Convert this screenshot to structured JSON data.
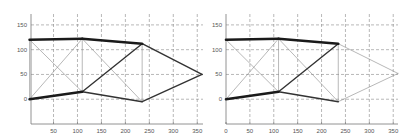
{
  "chart_data": [
    {
      "type": "line",
      "title": "",
      "xlabel": "",
      "ylabel": "",
      "xlim": [
        3,
        362
      ],
      "ylim": [
        -50,
        172
      ],
      "grid": true,
      "xticks": [
        50,
        100,
        150,
        200,
        250,
        300,
        350
      ],
      "yticks": [
        0,
        50,
        100,
        150
      ],
      "nodes": {
        "A": [
          0,
          120
        ],
        "B": [
          110,
          122
        ],
        "C": [
          235,
          112
        ],
        "D": [
          360,
          50
        ],
        "E": [
          0,
          0
        ],
        "F": [
          110,
          15
        ],
        "G": [
          235,
          -5
        ]
      },
      "members": [
        {
          "from": "A",
          "to": "B",
          "weight": "thick"
        },
        {
          "from": "B",
          "to": "C",
          "weight": "thick"
        },
        {
          "from": "E",
          "to": "F",
          "weight": "thick"
        },
        {
          "from": "F",
          "to": "C",
          "weight": "medium"
        },
        {
          "from": "C",
          "to": "D",
          "weight": "medium"
        },
        {
          "from": "D",
          "to": "G",
          "weight": "medium"
        },
        {
          "from": "F",
          "to": "G",
          "weight": "medium"
        },
        {
          "from": "A",
          "to": "F",
          "weight": "thin"
        },
        {
          "from": "E",
          "to": "B",
          "weight": "thin"
        },
        {
          "from": "A",
          "to": "E",
          "weight": "thin"
        },
        {
          "from": "B",
          "to": "F",
          "weight": "thin"
        },
        {
          "from": "B",
          "to": "G",
          "weight": "thin"
        },
        {
          "from": "C",
          "to": "G",
          "weight": "thin"
        }
      ]
    },
    {
      "type": "line",
      "title": "",
      "xlabel": "",
      "ylabel": "",
      "xlim": [
        0,
        360
      ],
      "ylim": [
        -50,
        172
      ],
      "grid": true,
      "xticks": [
        0,
        50,
        100,
        150,
        200,
        250,
        300,
        350
      ],
      "yticks": [
        0,
        50,
        100,
        150
      ],
      "nodes": {
        "A": [
          0,
          120
        ],
        "B": [
          110,
          122
        ],
        "C": [
          235,
          112
        ],
        "D": [
          360,
          52
        ],
        "E": [
          0,
          0
        ],
        "F": [
          110,
          15
        ],
        "G": [
          235,
          -5
        ]
      },
      "members": [
        {
          "from": "A",
          "to": "B",
          "weight": "thick"
        },
        {
          "from": "B",
          "to": "C",
          "weight": "thick"
        },
        {
          "from": "E",
          "to": "F",
          "weight": "thick"
        },
        {
          "from": "F",
          "to": "C",
          "weight": "medium"
        },
        {
          "from": "F",
          "to": "G",
          "weight": "medium"
        },
        {
          "from": "C",
          "to": "D",
          "weight": "thin"
        },
        {
          "from": "D",
          "to": "G",
          "weight": "thin"
        },
        {
          "from": "A",
          "to": "F",
          "weight": "thin"
        },
        {
          "from": "E",
          "to": "B",
          "weight": "thin"
        },
        {
          "from": "B",
          "to": "F",
          "weight": "thin"
        },
        {
          "from": "B",
          "to": "G",
          "weight": "thin"
        },
        {
          "from": "C",
          "to": "G",
          "weight": "thin"
        }
      ]
    }
  ]
}
